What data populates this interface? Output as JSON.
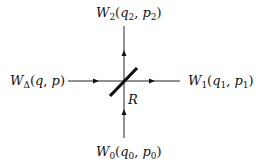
{
  "diagram": {
    "type": "beam-splitter",
    "colors": {
      "line": "#222222",
      "splitter": "#111111",
      "text": "#111111",
      "background": "#ffffff"
    },
    "splitter_label": "R",
    "ports": {
      "top": {
        "name": "W",
        "sub": "2",
        "args": [
          {
            "v": "q",
            "s": "2"
          },
          {
            "v": "p",
            "s": "2"
          }
        ],
        "direction": "output"
      },
      "left": {
        "name": "W",
        "sub": "Δ",
        "args": [
          {
            "v": "q",
            "s": ""
          },
          {
            "v": "p",
            "s": ""
          }
        ],
        "direction": "input"
      },
      "right": {
        "name": "W",
        "sub": "1",
        "args": [
          {
            "v": "q",
            "s": "1"
          },
          {
            "v": "p",
            "s": "1"
          }
        ],
        "direction": "output"
      },
      "bottom": {
        "name": "W",
        "sub": "0",
        "args": [
          {
            "v": "q",
            "s": "0"
          },
          {
            "v": "p",
            "s": "0"
          }
        ],
        "direction": "input"
      }
    },
    "labels": {
      "top": {
        "W": "W",
        "sub": "2",
        "open": "(",
        "q": "q",
        "qs": "2",
        "comma": ", ",
        "p": "p",
        "ps": "2",
        "close": ")"
      },
      "left": {
        "W": "W",
        "sub": "Δ",
        "open": "(",
        "q": "q",
        "comma": ", ",
        "p": "p",
        "close": ")"
      },
      "right": {
        "W": "W",
        "sub": "1",
        "open": "(",
        "q": "q",
        "qs": "1",
        "comma": ", ",
        "p": "p",
        "ps": "1",
        "close": ")"
      },
      "bottom": {
        "W": "W",
        "sub": "0",
        "open": "(",
        "q": "q",
        "qs": "0",
        "comma": ", ",
        "p": "p",
        "ps": "0",
        "close": ")"
      }
    }
  }
}
